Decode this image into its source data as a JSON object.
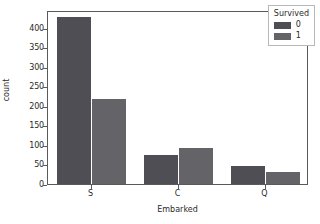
{
  "chart_data": {
    "type": "bar",
    "title": "",
    "xlabel": "Embarked",
    "ylabel": "count",
    "categories": [
      "S",
      "C",
      "Q"
    ],
    "series": [
      {
        "name": "0",
        "values": [
          427,
          75,
          47
        ],
        "color": "#4e4e54"
      },
      {
        "name": "1",
        "values": [
          217,
          93,
          30
        ],
        "color": "#646468"
      }
    ],
    "legend": {
      "title": "Survived",
      "position": "upper right",
      "entries": [
        {
          "label": "0",
          "color": "#4e4e54"
        },
        {
          "label": "1",
          "color": "#646468"
        }
      ]
    },
    "ylim": [
      0,
      445
    ],
    "yticks": [
      0,
      50,
      100,
      150,
      200,
      250,
      300,
      350,
      400
    ],
    "ytick_labels": [
      "0",
      "50",
      "100",
      "150",
      "200",
      "250",
      "300",
      "350",
      "400"
    ],
    "xtick_labels": [
      "S",
      "C",
      "Q"
    ],
    "grid": false
  }
}
